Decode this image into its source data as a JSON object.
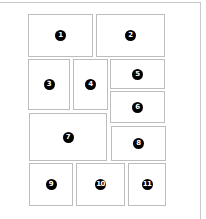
{
  "diagram": {
    "type": "page-layout",
    "panels": [
      {
        "id": "1",
        "label": "1"
      },
      {
        "id": "2",
        "label": "2"
      },
      {
        "id": "3",
        "label": "3"
      },
      {
        "id": "4",
        "label": "4"
      },
      {
        "id": "5",
        "label": "5"
      },
      {
        "id": "6",
        "label": "6"
      },
      {
        "id": "7",
        "label": "7"
      },
      {
        "id": "8",
        "label": "8"
      },
      {
        "id": "9",
        "label": "9"
      },
      {
        "id": "10",
        "label": "10"
      },
      {
        "id": "11",
        "label": "11"
      }
    ],
    "colors": {
      "badge_background": "#000000",
      "badge_text": "#ffffff",
      "panel_border": "#bdbdbd",
      "frame_border": "#c8c8c8"
    }
  }
}
